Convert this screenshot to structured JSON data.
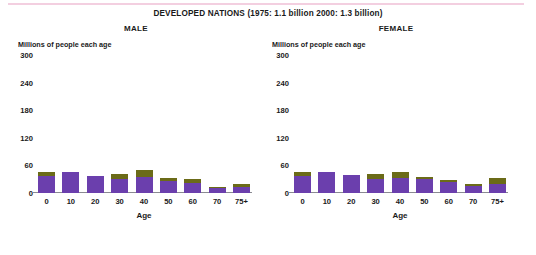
{
  "title": "DEVELOPED NATIONS (1975: 1.1 billion   2000: 1.3 billion)",
  "top_rule_color": "#f3cfe0",
  "chart_data": {
    "type": "bar",
    "title": "DEVELOPED NATIONS (1975: 1.1 billion   2000: 1.3 billion)",
    "xlabel": "Age",
    "ylabel": "Millions of people each age",
    "ylim": [
      0,
      300
    ],
    "yticks": [
      0,
      60,
      120,
      180,
      240,
      300
    ],
    "grid": true,
    "legend": "none",
    "stacked": true,
    "categories": [
      "0",
      "10",
      "20",
      "30",
      "40",
      "50",
      "60",
      "70",
      "75+"
    ],
    "series_colors": {
      "1975": "#6b3fad",
      "2000": "#6b6b18"
    },
    "panels": [
      {
        "name": "MALE",
        "panel_title": "MALE",
        "axis_note": "Millions of people each age",
        "series": [
          {
            "name": "1975",
            "values": [
              38,
              45,
              38,
              30,
              34,
              27,
              22,
              10,
              12
            ]
          },
          {
            "name": "2000",
            "values": [
              7,
              0,
              0,
              12,
              16,
              6,
              8,
              4,
              7
            ]
          }
        ],
        "totals": [
          45,
          45,
          38,
          42,
          50,
          33,
          30,
          14,
          19
        ]
      },
      {
        "name": "FEMALE",
        "panel_title": "FEMALE",
        "axis_note": "Millions of people each age",
        "series": [
          {
            "name": "1975",
            "values": [
              38,
              45,
              40,
              30,
              32,
              30,
              24,
              16,
              20
            ]
          },
          {
            "name": "2000",
            "values": [
              8,
              0,
              0,
              11,
              14,
              4,
              4,
              3,
              13
            ]
          }
        ],
        "totals": [
          46,
          45,
          40,
          41,
          46,
          34,
          28,
          19,
          33
        ]
      }
    ]
  }
}
